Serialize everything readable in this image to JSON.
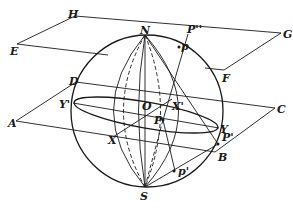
{
  "diagram": {
    "planes": {
      "upper_tangent_plane": {
        "corners": [
          "H",
          "G",
          "F",
          "E"
        ]
      },
      "equatorial_plane": {
        "corners": [
          "D",
          "C",
          "B",
          "A"
        ]
      }
    },
    "points": {
      "N": "N",
      "S": "S",
      "O": "O",
      "H": "H",
      "G": "G",
      "E": "E",
      "F": "F",
      "D": "D",
      "C": "C",
      "A": "A",
      "B": "B",
      "Y_prime": "Y'",
      "Y": "Y",
      "X_prime": "X'",
      "X": "X",
      "P": "P",
      "P_prime": "P'",
      "P_double_prime": "P''",
      "p": "p",
      "p_prime": "p'"
    },
    "colors": {
      "ink": "#1a1a1a",
      "background": "#ffffff"
    }
  }
}
